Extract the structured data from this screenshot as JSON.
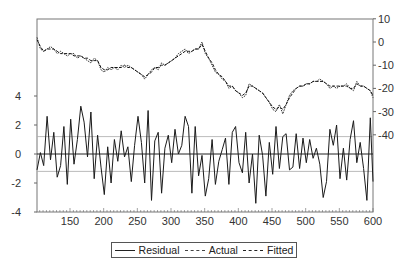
{
  "chart_data": {
    "type": "line",
    "title": "",
    "xlabel": "",
    "ylabel_left": "Residual",
    "ylabel_right": "Actual / Fitted",
    "xlim": [
      101,
      600
    ],
    "ylim_left": [
      -4,
      6
    ],
    "ylim_right": [
      -50,
      10
    ],
    "x_ticks": [
      150,
      200,
      250,
      300,
      350,
      400,
      450,
      500,
      550,
      600
    ],
    "left_ticks": [
      4,
      2,
      0,
      -2,
      -4
    ],
    "right_ticks": [
      10,
      0,
      -10,
      -20,
      -30,
      -40
    ],
    "residual_std_band": [
      1.2,
      -1.2
    ],
    "grid": false,
    "legend_position": "bottom",
    "legend": [
      "Residual",
      "Actual",
      "Fitted"
    ],
    "x": [
      101,
      106,
      111,
      116,
      121,
      126,
      131,
      136,
      141,
      146,
      151,
      156,
      161,
      166,
      171,
      176,
      181,
      186,
      191,
      196,
      201,
      206,
      211,
      216,
      221,
      226,
      231,
      236,
      241,
      246,
      251,
      256,
      261,
      266,
      271,
      276,
      281,
      286,
      291,
      296,
      301,
      306,
      311,
      316,
      321,
      326,
      331,
      336,
      341,
      346,
      351,
      356,
      361,
      366,
      371,
      376,
      381,
      386,
      391,
      396,
      401,
      406,
      411,
      416,
      421,
      426,
      431,
      436,
      441,
      446,
      451,
      456,
      461,
      466,
      471,
      476,
      481,
      486,
      491,
      496,
      501,
      506,
      511,
      516,
      521,
      526,
      531,
      536,
      541,
      546,
      551,
      556,
      561,
      566,
      571,
      576,
      581,
      586,
      591,
      596,
      600
    ],
    "series": [
      {
        "name": "Actual",
        "axis": "right",
        "values": [
          2,
          -3,
          -4,
          -3,
          -2,
          -3,
          -5,
          -4,
          -5,
          -6,
          -5,
          -5,
          -7,
          -6,
          -7,
          -8,
          -9,
          -7,
          -8,
          -12,
          -13,
          -11,
          -12,
          -11,
          -12,
          -10,
          -11,
          -10,
          -11,
          -12,
          -13,
          -14,
          -16,
          -14,
          -12,
          -11,
          -12,
          -9,
          -10,
          -9,
          -8,
          -7,
          -5,
          -4,
          -3,
          -5,
          -4,
          -3,
          -3,
          0,
          -5,
          -7,
          -10,
          -13,
          -14,
          -16,
          -17,
          -20,
          -19,
          -21,
          -22,
          -24,
          -23,
          -18,
          -19,
          -20,
          -21,
          -22,
          -24,
          -26,
          -29,
          -30,
          -27,
          -31,
          -27,
          -23,
          -21,
          -20,
          -19,
          -19,
          -18,
          -18,
          -17,
          -17,
          -16,
          -17,
          -18,
          -20,
          -19,
          -20,
          -19,
          -19,
          -18,
          -20,
          -21,
          -17,
          -19,
          -19,
          -20,
          -21,
          -24
        ]
      },
      {
        "name": "Fitted",
        "axis": "right",
        "values": [
          1,
          -2,
          -4,
          -3,
          -3,
          -3,
          -4,
          -5,
          -5,
          -5,
          -5,
          -6,
          -6,
          -6,
          -7,
          -7,
          -8,
          -8,
          -8,
          -11,
          -12,
          -12,
          -11,
          -11,
          -11,
          -11,
          -10,
          -11,
          -11,
          -12,
          -13,
          -14,
          -15,
          -14,
          -13,
          -11,
          -11,
          -10,
          -10,
          -9,
          -8,
          -7,
          -6,
          -5,
          -4,
          -4,
          -4,
          -3,
          -3,
          -1,
          -4,
          -7,
          -9,
          -12,
          -14,
          -15,
          -17,
          -19,
          -19,
          -21,
          -22,
          -23,
          -22,
          -19,
          -19,
          -20,
          -21,
          -22,
          -24,
          -26,
          -28,
          -29,
          -28,
          -29,
          -27,
          -24,
          -22,
          -20,
          -19,
          -19,
          -18,
          -18,
          -17,
          -17,
          -17,
          -17,
          -18,
          -19,
          -19,
          -19,
          -19,
          -19,
          -19,
          -20,
          -20,
          -18,
          -19,
          -19,
          -20,
          -21,
          -23
        ]
      },
      {
        "name": "Residual",
        "axis": "left",
        "values": [
          -1.1,
          0.1,
          -0.8,
          2.6,
          -0.4,
          1.5,
          -1.6,
          -0.8,
          1.9,
          -2.1,
          2.4,
          -0.7,
          1.0,
          3.3,
          2.2,
          -0.2,
          2.9,
          -1.7,
          1.3,
          -0.9,
          -2.8,
          0.5,
          -2.0,
          1.0,
          -0.5,
          1.6,
          -0.2,
          0.5,
          -1.9,
          0.6,
          2.6,
          0.8,
          -2.0,
          3.0,
          -3.2,
          0.9,
          1.5,
          -2.7,
          0.4,
          1.3,
          -0.6,
          1.7,
          0.0,
          0.6,
          2.6,
          1.9,
          -2.7,
          1.9,
          -1.5,
          -0.1,
          -2.9,
          -1.7,
          1.0,
          -2.1,
          -0.5,
          0.3,
          1.1,
          -2.1,
          1.5,
          1.9,
          -0.6,
          -1.3,
          1.5,
          -2.0,
          0.0,
          -3.4,
          1.3,
          -0.1,
          -2.9,
          0.8,
          -1.4,
          1.9,
          -1.0,
          1.2,
          1.4,
          -1.1,
          -0.9,
          1.4,
          -1.0,
          1.1,
          -0.6,
          1.0,
          -0.3,
          0.4,
          -0.7,
          -3.0,
          -1.9,
          1.7,
          0.6,
          2.0,
          -1.7,
          0.4,
          -1.8,
          1.0,
          2.3,
          -0.6,
          0.8,
          -1.0,
          -3.2,
          2.5,
          -1.9
        ]
      }
    ]
  },
  "legend": {
    "residual": "Residual",
    "actual": "Actual",
    "fitted": "Fitted"
  }
}
